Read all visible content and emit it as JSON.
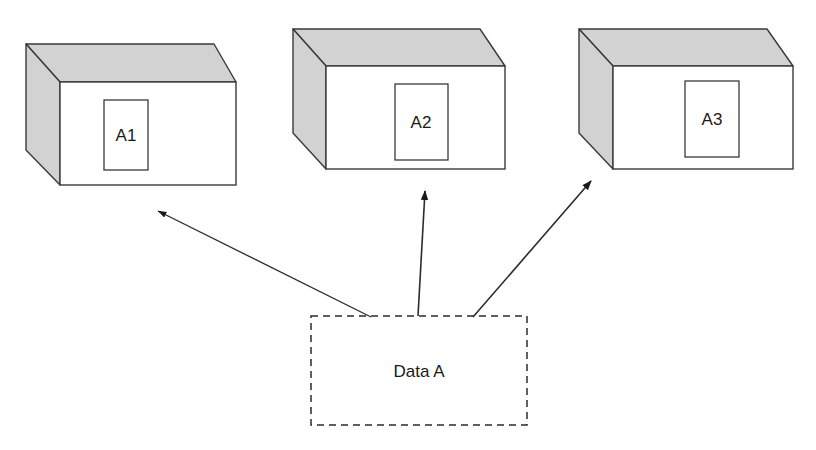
{
  "diagram": {
    "type": "block-diagram",
    "background_color": "#ffffff",
    "line_color": "#3a3a3a",
    "face_fill": "#ffffff",
    "shade_fill": "#d2d2d2",
    "text_color": "#1a1a1a",
    "nodes": [
      {
        "id": "unit-a1",
        "label": "A1",
        "shape": "cuboid",
        "front": {
          "x": 60,
          "y": 82,
          "width": 176,
          "height": 103
        },
        "depth": {
          "dx": -34,
          "dy": -38
        },
        "inner_rect": {
          "x": 104,
          "y": 100,
          "width": 44,
          "height": 70
        }
      },
      {
        "id": "unit-a2",
        "label": "A2",
        "shape": "cuboid",
        "front": {
          "x": 326,
          "y": 66,
          "width": 179,
          "height": 103
        },
        "depth": {
          "dx": -33,
          "dy": -37
        },
        "inner_rect": {
          "x": 395,
          "y": 84,
          "width": 53,
          "height": 76
        }
      },
      {
        "id": "unit-a3",
        "label": "A3",
        "shape": "cuboid",
        "front": {
          "x": 613,
          "y": 66,
          "width": 180,
          "height": 103
        },
        "depth": {
          "dx": -34,
          "dy": -37
        },
        "inner_rect": {
          "x": 685,
          "y": 81,
          "width": 54,
          "height": 76
        }
      }
    ],
    "source": {
      "id": "data-a",
      "label": "Data A",
      "shape": "dashed-rectangle",
      "rect": {
        "x": 311,
        "y": 316,
        "width": 216,
        "height": 109
      },
      "dash_pattern": "7 5"
    },
    "arrows": [
      {
        "id": "arrow-to-a1",
        "from": "data-a",
        "to": "unit-a1",
        "x1": 371,
        "y1": 317,
        "x2": 154,
        "y2": 207
      },
      {
        "id": "arrow-to-a2",
        "from": "data-a",
        "to": "unit-a2",
        "x1": 418,
        "y1": 316,
        "x2": 425,
        "y2": 185
      },
      {
        "id": "arrow-to-a3",
        "from": "data-a",
        "to": "unit-a3",
        "x1": 473,
        "y1": 317,
        "x2": 596,
        "y2": 176
      }
    ]
  }
}
